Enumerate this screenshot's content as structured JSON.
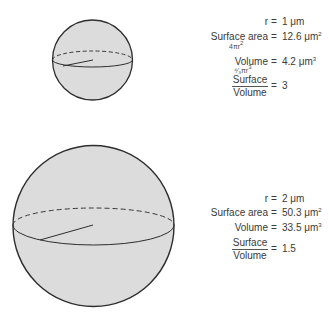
{
  "colors": {
    "sphere_fill": "#dcdcdc",
    "sphere_stroke": "#2e2e2e",
    "text": "#3a3a3a"
  },
  "spheres": [
    {
      "name": "small-sphere",
      "radius_label": "r = 1 μm",
      "r": {
        "label": "r",
        "eq": "=",
        "value": "1 μm"
      },
      "surface_area": {
        "label": "Surface area",
        "eq": "=",
        "value": "12.6 μm",
        "unit_exp": "2",
        "formula": "4πr",
        "formula_exp": "2"
      },
      "volume": {
        "label": "Volume",
        "eq": "=",
        "value": "4.2 μm",
        "unit_exp": "3",
        "formula": "⁴⁄₃πr",
        "formula_exp": "3"
      },
      "ratio": {
        "numerator": "Surface",
        "denominator": "Volume",
        "eq": "=",
        "value": "3"
      }
    },
    {
      "name": "large-sphere",
      "r": {
        "label": "r",
        "eq": "=",
        "value": "2 μm"
      },
      "surface_area": {
        "label": "Surface area",
        "eq": "=",
        "value": "50.3 μm",
        "unit_exp": "2"
      },
      "volume": {
        "label": "Volume",
        "eq": "=",
        "value": "33.5 μm",
        "unit_exp": "3"
      },
      "ratio": {
        "numerator": "Surface",
        "denominator": "Volume",
        "eq": "=",
        "value": "1.5"
      }
    }
  ]
}
